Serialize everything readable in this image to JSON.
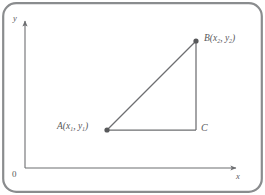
{
  "figure": {
    "background_color": "#ffffff",
    "frame_color": "#8a8c8e",
    "stroke_color": "#6d6e71",
    "text_color": "#58595b"
  },
  "axes": {
    "x_label": "x",
    "y_label": "y",
    "origin_label": "0",
    "x_axis_start": [
      25,
      168
    ],
    "x_axis_end": [
      240,
      168
    ],
    "y_axis_start": [
      25,
      168
    ],
    "y_axis_end": [
      25,
      17
    ],
    "arrowheads": true,
    "ticks": [],
    "grid": false
  },
  "points": [
    {
      "id": "A",
      "name": "A",
      "label_html": "A(x<sub>1</sub>, y<sub>1</sub>)",
      "label_text": "A(x1, y1)",
      "px": [
        107,
        130
      ],
      "marker": "filled-circle"
    },
    {
      "id": "B",
      "name": "B",
      "label_html": "B(x<sub>2</sub>, y<sub>2</sub>)",
      "label_text": "B(x2, y2)",
      "px": [
        196,
        41
      ],
      "marker": "filled-circle"
    },
    {
      "id": "C",
      "name": "C",
      "label_html": "C",
      "label_text": "C",
      "px": [
        196,
        130
      ],
      "marker": "none"
    }
  ],
  "segments": [
    {
      "name": "hypotenuse-ab",
      "from": "A",
      "to": "B"
    },
    {
      "name": "leg-ac",
      "from": "A",
      "to": "C"
    },
    {
      "name": "leg-bc",
      "from": "B",
      "to": "C"
    }
  ]
}
